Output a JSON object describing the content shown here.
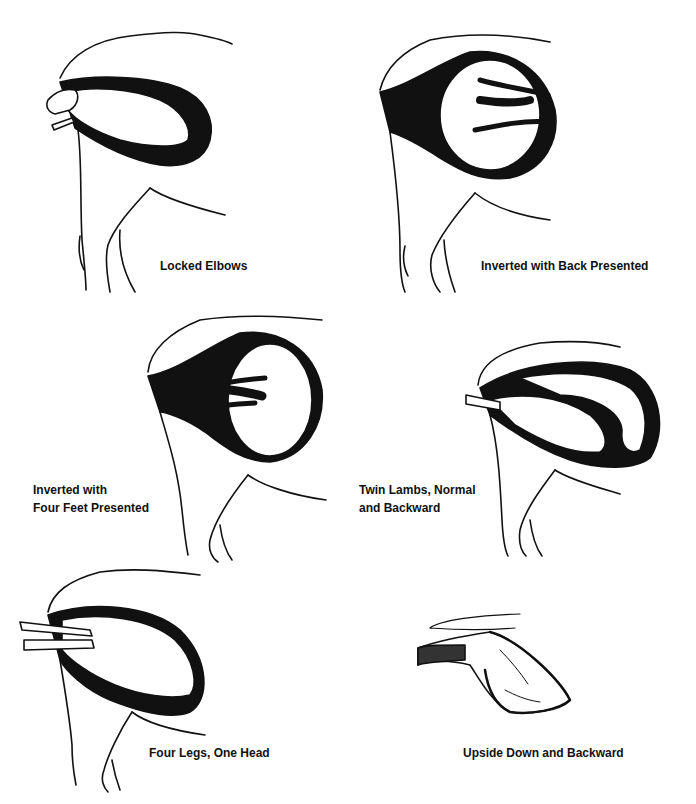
{
  "figure": {
    "panels": [
      {
        "id": "locked-elbows",
        "lines": [
          "Locked Elbows"
        ]
      },
      {
        "id": "inverted-back",
        "lines": [
          "Inverted with Back Presented"
        ]
      },
      {
        "id": "inverted-four-feet",
        "lines": [
          "Inverted with",
          "Four Feet Presented"
        ]
      },
      {
        "id": "twin-lambs",
        "lines": [
          "Twin Lambs, Normal",
          "and Backward"
        ]
      },
      {
        "id": "four-legs-one-head",
        "lines": [
          "Four Legs, One Head"
        ]
      },
      {
        "id": "upside-down-backward",
        "lines": [
          "Upside Down and Backward"
        ]
      }
    ],
    "colors": {
      "ink": "#111111",
      "background": "#ffffff"
    }
  }
}
